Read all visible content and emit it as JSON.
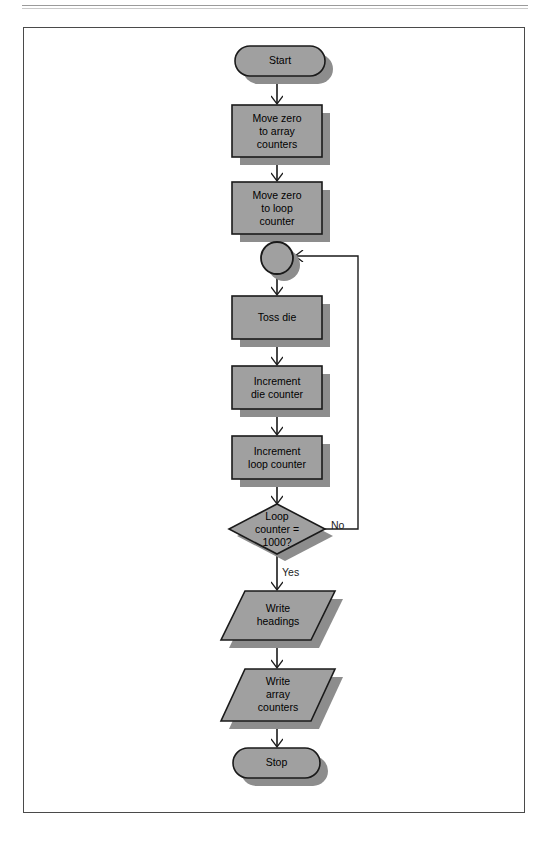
{
  "page": {
    "background": "#ffffff",
    "frame_border_color": "#4a4a4a"
  },
  "style": {
    "shape_fill": "#a0a0a0",
    "shape_stroke": "#1a1a1a",
    "shadow_fill": "#8d8d8d",
    "connector_stroke": "#1a1a1a",
    "text_color": "#000000"
  },
  "diagram": {
    "type": "flowchart",
    "nodes": [
      {
        "id": "start",
        "shape": "terminator",
        "label": "Start",
        "x": 235,
        "y": 46,
        "w": 90,
        "h": 30
      },
      {
        "id": "move-zero-array",
        "shape": "process",
        "label": "Move zero\nto array\ncounters",
        "x": 232,
        "y": 105,
        "w": 90,
        "h": 52
      },
      {
        "id": "move-zero-loop",
        "shape": "process",
        "label": "Move zero\nto loop\ncounter",
        "x": 232,
        "y": 182,
        "w": 90,
        "h": 52
      },
      {
        "id": "connector",
        "shape": "connector",
        "label": "",
        "x": 261,
        "y": 242,
        "w": 32,
        "h": 32
      },
      {
        "id": "toss-die",
        "shape": "process",
        "label": "Toss die",
        "x": 232,
        "y": 296,
        "w": 90,
        "h": 43
      },
      {
        "id": "increment-die",
        "shape": "process",
        "label": "Increment\ndie counter",
        "x": 232,
        "y": 366,
        "w": 90,
        "h": 43
      },
      {
        "id": "increment-loop",
        "shape": "process",
        "label": "Increment\nloop counter",
        "x": 232,
        "y": 436,
        "w": 90,
        "h": 43
      },
      {
        "id": "loop-decision",
        "shape": "decision",
        "label": "Loop\ncounter  =\n1000?",
        "x": 229,
        "y": 504,
        "w": 96,
        "h": 50
      },
      {
        "id": "write-headings",
        "shape": "io",
        "label": "Write\nheadings",
        "x": 227,
        "y": 591,
        "w": 100,
        "h": 49
      },
      {
        "id": "write-array-counters",
        "shape": "io",
        "label": "Write\narray\ncounters",
        "x": 227,
        "y": 669,
        "w": 100,
        "h": 52
      },
      {
        "id": "stop",
        "shape": "terminator",
        "label": "Stop",
        "x": 233,
        "y": 748,
        "w": 87,
        "h": 30
      }
    ],
    "edges": [
      {
        "id": "e-start-array",
        "from": "start",
        "to": "move-zero-array",
        "label": ""
      },
      {
        "id": "e-array-loop",
        "from": "move-zero-array",
        "to": "move-zero-loop",
        "label": ""
      },
      {
        "id": "e-loop-connector",
        "from": "move-zero-loop",
        "to": "connector",
        "label": ""
      },
      {
        "id": "e-connector-toss",
        "from": "connector",
        "to": "toss-die",
        "label": ""
      },
      {
        "id": "e-toss-incdie",
        "from": "toss-die",
        "to": "increment-die",
        "label": ""
      },
      {
        "id": "e-incdie-incloop",
        "from": "increment-die",
        "to": "increment-loop",
        "label": ""
      },
      {
        "id": "e-incloop-decision",
        "from": "increment-loop",
        "to": "loop-decision",
        "label": ""
      },
      {
        "id": "e-decision-no",
        "from": "loop-decision",
        "to": "connector",
        "label": "No"
      },
      {
        "id": "e-decision-yes",
        "from": "loop-decision",
        "to": "write-headings",
        "label": "Yes"
      },
      {
        "id": "e-headings-counters",
        "from": "write-headings",
        "to": "write-array-counters",
        "label": ""
      },
      {
        "id": "e-counters-stop",
        "from": "write-array-counters",
        "to": "stop",
        "label": ""
      }
    ],
    "edge_labels": {
      "no": "No",
      "yes": "Yes"
    }
  }
}
